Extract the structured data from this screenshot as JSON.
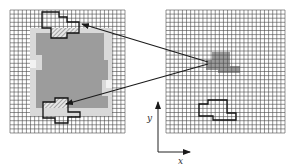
{
  "figure": {
    "left_panel": {
      "grid_cols": 28,
      "grid_rows": 30,
      "regions": [
        "light-gray-boundary-band",
        "dark-gray-interior",
        "top-outlined-shape",
        "bottom-outlined-shape"
      ]
    },
    "right_panel": {
      "grid_cols": 29,
      "grid_rows": 30,
      "regions": [
        "gray-patch",
        "outlined-shape"
      ]
    },
    "arrows": [
      {
        "from": "right-panel-gray-patch",
        "to": "left-panel-top-shape"
      },
      {
        "from": "right-panel-gray-patch",
        "to": "left-panel-bottom-shape"
      }
    ],
    "axes": {
      "x_label": "x",
      "y_label": "y"
    }
  },
  "colors": {
    "grid_line": "#4a4a4a",
    "dark_gray": "#9a9a9a",
    "light_gray": "#d6d6d6",
    "outline": "#111111",
    "hatch": "#8a8a8a",
    "arrow": "#1a1a1a"
  }
}
